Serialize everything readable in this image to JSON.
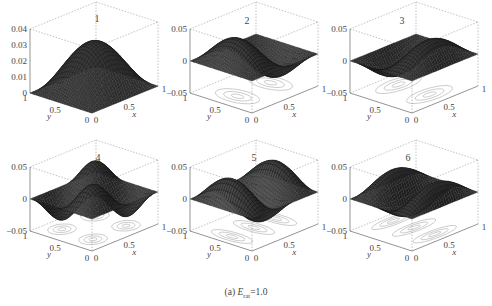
{
  "figure": {
    "caption_prefix": "(a) ",
    "caption_var": "E",
    "caption_sub": "rat",
    "caption_suffix": "=1.0"
  },
  "chart_data": [
    {
      "type": "surface",
      "title": "1",
      "zlim": [
        0,
        0.04
      ],
      "zticks": [
        "0.04",
        "0.03",
        "0.02",
        "0.01",
        "0"
      ],
      "xticks": [
        "0",
        "0.5",
        "1"
      ],
      "yticks": [
        "0",
        "0.5",
        "1"
      ],
      "xlabel": "x",
      "ylabel": "y",
      "mode": [
        1,
        1
      ],
      "amp": 0.03,
      "contour": false
    },
    {
      "type": "surface",
      "title": "2",
      "zlim": [
        -0.05,
        0.05
      ],
      "zticks": [
        "0.05",
        "0",
        "-0.05"
      ],
      "xticks": [
        "0",
        "0.5",
        "1"
      ],
      "yticks": [
        "0",
        "0.5",
        "1"
      ],
      "xlabel": "x",
      "ylabel": "y",
      "mode": [
        2,
        1
      ],
      "amp": 0.04,
      "contour": true
    },
    {
      "type": "surface",
      "title": "3",
      "zlim": [
        -0.05,
        0.05
      ],
      "zticks": [
        "0.05",
        "0",
        "-0.05"
      ],
      "xticks": [
        "0",
        "0.5",
        "1"
      ],
      "yticks": [
        "0",
        "0.5",
        "1"
      ],
      "xlabel": "x",
      "ylabel": "y",
      "mode": [
        1,
        2
      ],
      "amp": 0.035,
      "contour": true
    },
    {
      "type": "surface",
      "title": "4",
      "zlim": [
        -0.05,
        0.05
      ],
      "zticks": [
        "0.05",
        "0",
        "-0.05"
      ],
      "xticks": [
        "0",
        "0.5",
        "1"
      ],
      "yticks": [
        "0",
        "0.5",
        "1"
      ],
      "xlabel": "x",
      "ylabel": "y",
      "mode": [
        2,
        2
      ],
      "amp": 0.035,
      "contour": true
    },
    {
      "type": "surface",
      "title": "5",
      "zlim": [
        -0.05,
        0.05
      ],
      "zticks": [
        "0.05",
        "0",
        "-0.05"
      ],
      "xticks": [
        "0",
        "0.5",
        "1"
      ],
      "yticks": [
        "0",
        "0.5",
        "1"
      ],
      "xlabel": "x",
      "ylabel": "y",
      "mode": [
        3,
        1
      ],
      "amp": 0.04,
      "contour": true
    },
    {
      "type": "surface",
      "title": "6",
      "zlim": [
        -0.05,
        0.05
      ],
      "zticks": [
        "0.05",
        "0",
        "-0.05"
      ],
      "xticks": [
        "0",
        "0.5",
        "1"
      ],
      "yticks": [
        "0",
        "0.5",
        "1"
      ],
      "xlabel": "x",
      "ylabel": "y",
      "mode": [
        1,
        3
      ],
      "amp": 0.03,
      "contour": true
    }
  ]
}
